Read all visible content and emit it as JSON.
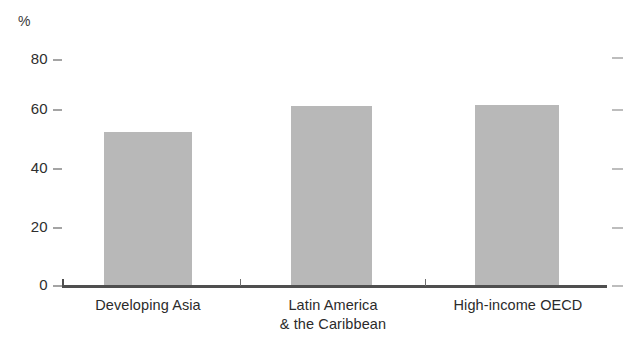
{
  "chart_data": {
    "type": "bar",
    "title": "",
    "subtitle": "",
    "xlabel": "",
    "ylabel": "%",
    "unit": "%",
    "categories": [
      "Developing Asia",
      "Latin America\n& the Caribbean",
      "High-income OECD"
    ],
    "category_lines": [
      [
        "Developing Asia"
      ],
      [
        "Latin America",
        "& the Caribbean"
      ],
      [
        "High-income OECD"
      ]
    ],
    "values": [
      54,
      63,
      63.5
    ],
    "ylim": [
      0,
      80
    ],
    "yticks": [
      0,
      20,
      40,
      60,
      80
    ],
    "ytick_labels": [
      "0",
      "20",
      "40",
      "60",
      "80"
    ],
    "grid": false,
    "legend": null,
    "bar_color": "#b8b8b8",
    "axis_color": "#4f4f4f",
    "text_color": "#2b2b2b",
    "right_axis_ticks": true
  },
  "axis": {
    "unit_label": "%",
    "tick_80": "80",
    "tick_60": "60",
    "tick_40": "40",
    "tick_20": "20",
    "tick_0": "0"
  },
  "categories": {
    "c0_l0": "Developing Asia",
    "c1_l0": "Latin America",
    "c1_l1": "& the Caribbean",
    "c2_l0": "High-income OECD"
  }
}
